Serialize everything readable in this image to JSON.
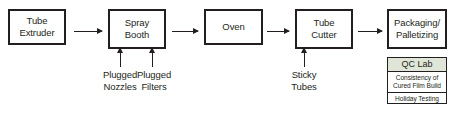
{
  "diagram": {
    "type": "process-flow",
    "title": "",
    "nodes": [
      {
        "id": "tube-extruder",
        "label": "Tube\nExtruder"
      },
      {
        "id": "spray-booth",
        "label": "Spray\nBooth"
      },
      {
        "id": "oven",
        "label": "Oven"
      },
      {
        "id": "tube-cutter",
        "label": "Tube\nCutter"
      },
      {
        "id": "packaging-palletizing",
        "label": "Packaging/\nPalletizing"
      }
    ],
    "flow_arrows": [
      {
        "from": "tube-extruder",
        "to": "spray-booth"
      },
      {
        "from": "spray-booth",
        "to": "oven"
      },
      {
        "from": "oven",
        "to": "tube-cutter"
      },
      {
        "from": "tube-cutter",
        "to": "packaging-palletizing"
      }
    ],
    "inputs": [
      {
        "id": "plugged-nozzles",
        "label": "Plugged\nNozzles",
        "target": "spray-booth"
      },
      {
        "id": "plugged-filters",
        "label": "Plugged\nFilters",
        "target": "spray-booth"
      },
      {
        "id": "sticky-tubes",
        "label": "Sticky\nTubes",
        "target": "tube-cutter"
      }
    ]
  },
  "qc_lab": {
    "header": "QC Lab",
    "header_color": "#dfe6d8",
    "rows": [
      "Consistency of\nCured Film Build",
      "Holiday Testing"
    ]
  }
}
